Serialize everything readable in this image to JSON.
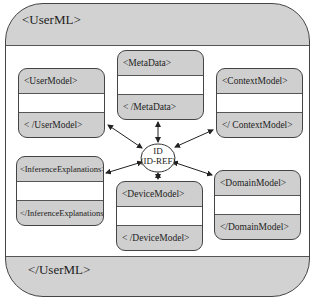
{
  "diagram": {
    "title_open": "<UserML>",
    "title_close": "</UserML>",
    "center": {
      "line1": "ID",
      "line2": "(ID-REF)"
    },
    "boxes": {
      "metadata": {
        "open": "<MetaData>",
        "close": "< /MetaData>"
      },
      "usermodel": {
        "open": "<UserModel>",
        "close": "< /UserModel>"
      },
      "contextmodel": {
        "open": "<ContextModel>",
        "close": "</ ContextModel>"
      },
      "inference": {
        "open": "<InferenceExplanations>",
        "close": "</InferenceExplanations>"
      },
      "devicemodel": {
        "open": "<DeviceModel>",
        "close": "< /DeviceModel>"
      },
      "domainmodel": {
        "open": "<DomainModel>",
        "close": "</DomainModel>"
      }
    },
    "colors": {
      "fill": "#cfcfcf",
      "border": "#444444",
      "background": "#ffffff"
    }
  }
}
